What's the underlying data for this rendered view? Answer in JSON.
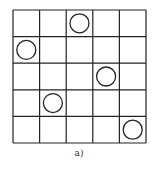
{
  "figure": {
    "caption": "a)",
    "grid": {
      "rows": 5,
      "cols": 5,
      "line_color": "#222222",
      "background": "#ffffff"
    },
    "circles": [
      {
        "row": 0,
        "col": 2
      },
      {
        "row": 1,
        "col": 0
      },
      {
        "row": 2,
        "col": 3
      },
      {
        "row": 3,
        "col": 1
      },
      {
        "row": 4,
        "col": 4
      }
    ]
  }
}
